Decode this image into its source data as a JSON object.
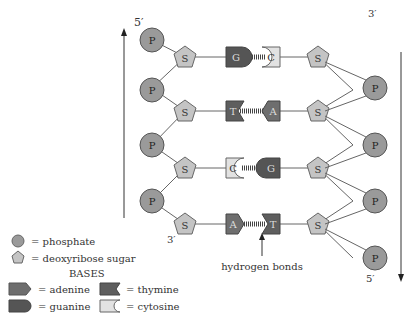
{
  "colors": {
    "phosphate": "#9a9a9a",
    "sugar": "#c4c4c4",
    "adenine": "#6e6e6e",
    "guanine": "#555555",
    "thymine": "#5e5e5e",
    "cytosine": "#e2e2e2",
    "stroke": "#555555",
    "bond": "#444444"
  },
  "strand_labels": {
    "left_top": "5′",
    "left_bottom": "3′",
    "right_top": "3′",
    "right_bottom": "5′"
  },
  "phosphate_letter": "P",
  "sugar_letter": "S",
  "pairs": [
    {
      "left": "G",
      "right": "C"
    },
    {
      "left": "T",
      "right": "A"
    },
    {
      "left": "C",
      "right": "G"
    },
    {
      "left": "A",
      "right": "T"
    }
  ],
  "annotation": {
    "hydrogen_bonds": "hydrogen bonds"
  },
  "legend": {
    "phosphate": "= phosphate",
    "sugar": "= deoxyribose sugar",
    "bases_title": "BASES",
    "adenine": "= adenine",
    "guanine": "= guanine",
    "thymine": "= thymine",
    "cytosine": "= cytosine"
  }
}
